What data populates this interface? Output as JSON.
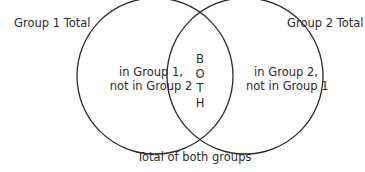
{
  "diagram": {
    "type": "venn",
    "circles": [
      {
        "name": "Group 1",
        "cx": 155,
        "cy": 76,
        "r": 78,
        "stroke": "#2b2b2b"
      },
      {
        "name": "Group 2",
        "cx": 245,
        "cy": 76,
        "r": 78,
        "stroke": "#2b2b2b"
      }
    ],
    "labels": {
      "group1_total": "Group 1 Total",
      "group2_total": "Group 2 Total",
      "only_group1_line1": "in Group 1,",
      "only_group1_line2": "not in Group 2",
      "only_group2_line1": "in Group 2,",
      "only_group2_line2": "not in Group 1",
      "both_letters": [
        "B",
        "O",
        "T",
        "H"
      ],
      "total_both": "Total of both groups"
    }
  }
}
